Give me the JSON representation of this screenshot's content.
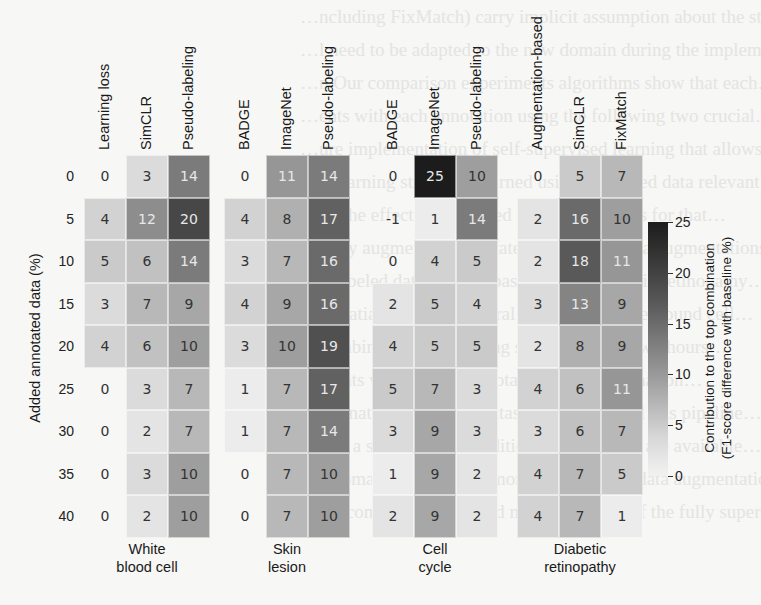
{
  "chart_data": {
    "type": "heatmap",
    "title": "",
    "ylabel": "Added annotated data (%)",
    "rows": [
      "0",
      "5",
      "10",
      "15",
      "20",
      "25",
      "30",
      "35",
      "40"
    ],
    "groups": [
      {
        "name": "White\nblood cell",
        "label_lines": [
          "White",
          "blood cell"
        ],
        "columns": [
          "Learning loss",
          "SimCLR",
          "Pseudo-labeling"
        ],
        "values": [
          [
            0,
            3,
            14
          ],
          [
            4,
            12,
            20
          ],
          [
            5,
            6,
            14
          ],
          [
            3,
            7,
            9
          ],
          [
            4,
            6,
            10
          ],
          [
            0,
            3,
            7
          ],
          [
            0,
            2,
            7
          ],
          [
            0,
            3,
            10
          ],
          [
            0,
            2,
            10
          ]
        ]
      },
      {
        "name": "Skin\nlesion",
        "label_lines": [
          "Skin",
          "lesion"
        ],
        "columns": [
          "BADGE",
          "ImageNet",
          "Pseudo-labeling"
        ],
        "values": [
          [
            0,
            11,
            14
          ],
          [
            4,
            8,
            17
          ],
          [
            3,
            7,
            16
          ],
          [
            4,
            9,
            16
          ],
          [
            3,
            10,
            19
          ],
          [
            1,
            7,
            17
          ],
          [
            1,
            7,
            14
          ],
          [
            0,
            7,
            10
          ],
          [
            0,
            7,
            10
          ]
        ]
      },
      {
        "name": "Cell\ncycle",
        "label_lines": [
          "Cell",
          "cycle"
        ],
        "columns": [
          "BADGE",
          "ImageNet",
          "Pseudo-labeling"
        ],
        "values": [
          [
            0,
            25,
            10
          ],
          [
            -1,
            1,
            14
          ],
          [
            0,
            4,
            5
          ],
          [
            2,
            5,
            4
          ],
          [
            4,
            5,
            5
          ],
          [
            5,
            7,
            3
          ],
          [
            3,
            9,
            3
          ],
          [
            1,
            9,
            2
          ],
          [
            2,
            9,
            2
          ]
        ]
      },
      {
        "name": "Diabetic\nretinopathy",
        "label_lines": [
          "Diabetic",
          "retinopathy"
        ],
        "columns": [
          "Augmentation-based",
          "SimCLR",
          "FixMatch"
        ],
        "values": [
          [
            0,
            5,
            7
          ],
          [
            2,
            16,
            10
          ],
          [
            2,
            18,
            11
          ],
          [
            3,
            13,
            9
          ],
          [
            2,
            8,
            9
          ],
          [
            4,
            6,
            11
          ],
          [
            3,
            6,
            7
          ],
          [
            4,
            7,
            5
          ],
          [
            4,
            7,
            1
          ]
        ]
      }
    ],
    "colorbar": {
      "label_lines": [
        "Contribution to the top combination",
        "(F1-score difference with baseline %)"
      ],
      "ticks": [
        "0",
        "5",
        "10",
        "15",
        "20",
        "25"
      ],
      "range": [
        0,
        25
      ],
      "colormap": "greys"
    }
  },
  "background_text": [
    "…ncluding FixMatch) carry implicit assumption about the sta…",
    "…l need to be adapted to the new domain during the implemen…",
    "",
    "…n Our comparison experiments algorithms show that each…",
    "…ents with each annotation using the following two crucial…",
    "…ure implementation of self-supervised learning that allows…",
    "…d learning strategies learned using unlabeled data relevant…",
    "…ng the effect and selected pipeline methods for that…",
    "…ly by augmenting annotated unlabelled data augmentations…",
    "…h labeled data settings based on the Diabetic retinopathy…",
    "…e spatial filter in temporal dimension to-the-bound cell…",
    "…combining three learning strategies from two hours…",
    "",
    "…ments with labeled annotation data combination…",
    "…mbination of labeled dataset that improved this pipeline…",
    "…d in a scenario with additional annotations are available…",
    "…e domain will achieve more improved F1 data augmentation…",
    "…his combination reached more than 80% of the fully supervised…"
  ]
}
